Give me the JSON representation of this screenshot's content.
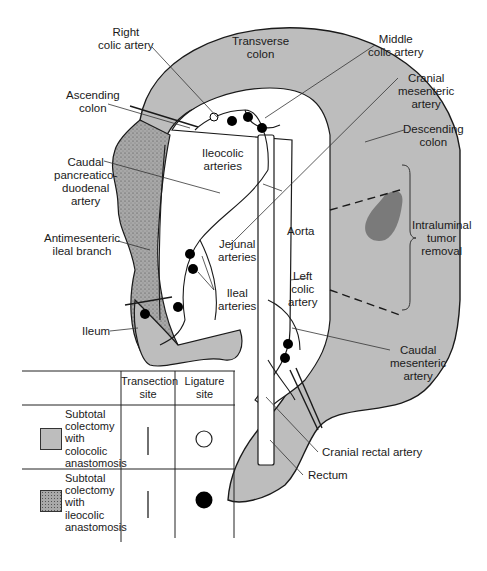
{
  "diagram": {
    "colors": {
      "colon_fill": "#bdbdbd",
      "ileum_dotted_fill": "#a9a9a9",
      "tumor_fill": "#7a7a7a",
      "line": "#1a1a1a",
      "background": "#ffffff"
    },
    "labels": {
      "right_colic_artery": "Right\ncolic artery",
      "transverse_colon": "Transverse\ncolon",
      "middle_colic_artery": "Middle\ncolic artery",
      "cranial_mesenteric_artery": "Cranial\nmesenteric\nartery",
      "ascending_colon": "Ascending\ncolon",
      "descending_colon": "Descending\ncolon",
      "caudal_pancreaticoduodenal_artery": "Caudal\npancreatico-\nduodenal\nartery",
      "ileocolic_arteries": "Ileocolic\narteries",
      "antimesenteric_ileal_branch": "Antimesenteric\nileal branch",
      "intraluminal_tumor_removal": "Intraluminal\ntumor\nremoval",
      "aorta": "Aorta",
      "jejunal_arteries": "Jejunal\narteries",
      "left_colic_artery": "Left\ncolic\nartery",
      "ileal_arteries": "Ileal\narteries",
      "ileum": "Ileum",
      "caudal_mesenteric_artery": "Caudal\nmesenteric\nartery",
      "cranial_rectal_artery": "Cranial rectal artery",
      "rectum": "Rectum"
    }
  },
  "legend": {
    "columns": [
      "",
      "Transection\nsite",
      "Ligature\nsite"
    ],
    "rows": [
      {
        "swatch": "plain-gray",
        "label": "Subtotal\ncolectomy\nwith\ncolocolic\nanastomosis",
        "transection_symbol": "vertical-line",
        "ligature_symbol": "open-circle"
      },
      {
        "swatch": "dotted-gray",
        "label": "Subtotal\ncolectomy\nwith\nileocolic\nanastomosis",
        "transection_symbol": "vertical-line",
        "ligature_symbol": "filled-circle"
      }
    ]
  }
}
